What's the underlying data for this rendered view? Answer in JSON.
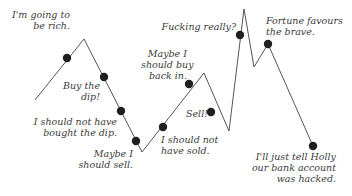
{
  "colors": {
    "line": "#555555",
    "dot": "#1f1f1f",
    "text": "#3a3a3a",
    "background": "#ffffff"
  },
  "path_points": [
    [
      35,
      100
    ],
    [
      84,
      39
    ],
    [
      142,
      152
    ],
    [
      204,
      73
    ],
    [
      229,
      131
    ],
    [
      244,
      9
    ],
    [
      254,
      67
    ],
    [
      268,
      44
    ],
    [
      313,
      146
    ]
  ],
  "markers": [
    [
      67,
      58
    ],
    [
      104,
      77
    ],
    [
      121,
      111
    ],
    [
      136,
      141
    ],
    [
      163,
      127
    ],
    [
      189,
      84
    ],
    [
      211,
      112
    ],
    [
      240,
      35
    ],
    [
      268,
      44
    ],
    [
      313,
      146
    ]
  ],
  "labels": [
    {
      "text": "I'm going to\nbe rich.",
      "x": 4,
      "y": 9,
      "w": 66,
      "align": "right"
    },
    {
      "text": "Buy the\ndip!",
      "x": 56,
      "y": 80,
      "w": 44,
      "align": "right"
    },
    {
      "text": "I should not have\nbought the dip.",
      "x": 26,
      "y": 116,
      "w": 91,
      "align": "right"
    },
    {
      "text": "Maybe I\nshould sell.",
      "x": 70,
      "y": 148,
      "w": 63,
      "align": "right"
    },
    {
      "text": "I should not\nhave sold.",
      "x": 161,
      "y": 134,
      "w": 60,
      "align": "left"
    },
    {
      "text": "Maybe I\nshould buy\nback in.",
      "x": 141,
      "y": 48,
      "w": 46,
      "align": "right"
    },
    {
      "text": "Sell!",
      "x": 184,
      "y": 108,
      "w": 24,
      "align": "right"
    },
    {
      "text": "Fucking really?",
      "x": 158,
      "y": 21,
      "w": 78,
      "align": "right"
    },
    {
      "text": "Fortune favours\nthe brave.",
      "x": 266,
      "y": 15,
      "w": 84,
      "align": "left"
    },
    {
      "text": "I'll just tell Holly\nour bank account\nwas hacked.",
      "x": 236,
      "y": 151,
      "w": 100,
      "align": "right"
    }
  ]
}
